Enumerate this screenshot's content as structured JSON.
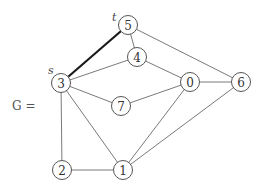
{
  "graph": {
    "name_label": "G =",
    "source_label": "s",
    "target_label": "t",
    "nodes": [
      {
        "id": "0",
        "x": 190,
        "y": 82
      },
      {
        "id": "1",
        "x": 123,
        "y": 170
      },
      {
        "id": "2",
        "x": 62,
        "y": 170
      },
      {
        "id": "3",
        "x": 61,
        "y": 83
      },
      {
        "id": "4",
        "x": 137,
        "y": 57
      },
      {
        "id": "5",
        "x": 128,
        "y": 25
      },
      {
        "id": "6",
        "x": 241,
        "y": 82
      },
      {
        "id": "7",
        "x": 121,
        "y": 106
      }
    ],
    "edges": [
      {
        "from": "3",
        "to": "5",
        "highlighted": true
      },
      {
        "from": "5",
        "to": "4",
        "highlighted": false
      },
      {
        "from": "5",
        "to": "6",
        "highlighted": false
      },
      {
        "from": "3",
        "to": "4",
        "highlighted": false
      },
      {
        "from": "4",
        "to": "0",
        "highlighted": false
      },
      {
        "from": "3",
        "to": "7",
        "highlighted": false
      },
      {
        "from": "7",
        "to": "0",
        "highlighted": false
      },
      {
        "from": "0",
        "to": "6",
        "highlighted": false
      },
      {
        "from": "3",
        "to": "2",
        "highlighted": false
      },
      {
        "from": "3",
        "to": "1",
        "highlighted": false
      },
      {
        "from": "2",
        "to": "1",
        "highlighted": false
      },
      {
        "from": "0",
        "to": "1",
        "highlighted": false
      },
      {
        "from": "6",
        "to": "1",
        "highlighted": false
      }
    ],
    "colors": {
      "edge": "#6a6a6a",
      "highlighted_edge": "#1a1a1a",
      "node_stroke": "#555555"
    }
  }
}
